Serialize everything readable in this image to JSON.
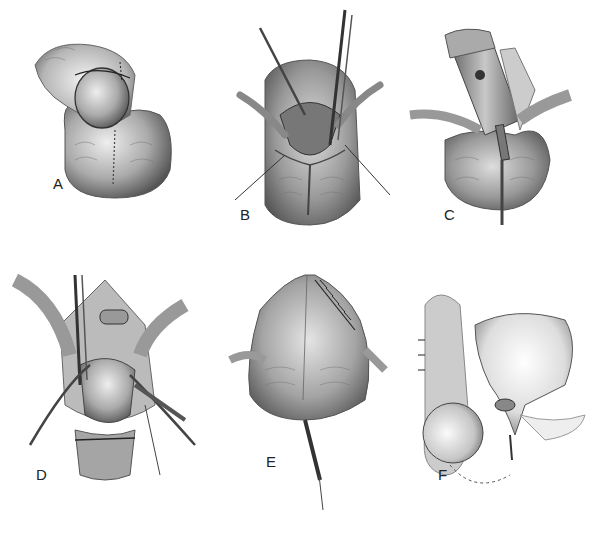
{
  "figure": {
    "type": "surgical-illustration",
    "panel_count": 6,
    "style": "grayscale pencil drawing",
    "panels": [
      {
        "label": "A",
        "description": "Circumferential incision marked around penile shaft with midline scrotal incision line"
      },
      {
        "label": "B",
        "description": "Scrotal skin opened with retractors and forceps; dissection at base"
      },
      {
        "label": "C",
        "description": "Penile shaft degloved and mobilized with catheter in place; retractors spreading skin"
      },
      {
        "label": "D",
        "description": "Deep dissection with clamps and retractors; penis reflected downward, sutured structure at top"
      },
      {
        "label": "E",
        "description": "Closure of scrotal skin with interrupted sutures; drains placed on both sides; catheter below"
      },
      {
        "label": "F",
        "description": "Lateral sagittal view showing bladder, testis and spermatic structures; dashed line indicates outline"
      }
    ],
    "caption": ""
  },
  "colors": {
    "background": "#ffffff",
    "ink": "#222222",
    "tissue_dark": "#6e6e6e",
    "tissue_mid": "#9c9c9c",
    "tissue_light": "#d6d6d6",
    "shadow": "#e8e8e8"
  }
}
